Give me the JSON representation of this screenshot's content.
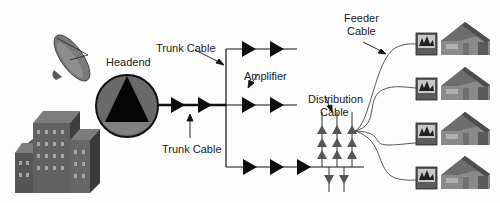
{
  "diagram": {
    "type": "cable-tv-network-topology",
    "labels": {
      "headend": "Headend",
      "trunk_cable_top": "Trunk Cable",
      "trunk_cable_bottom": "Trunk Cable",
      "amplifier": "Amplifier",
      "distribution_cable_line1": "Distribution",
      "distribution_cable_line2": "Cable",
      "feeder_cable_line1": "Feeder",
      "feeder_cable_line2": "Cable"
    },
    "nodes": [
      {
        "id": "satellite-dish",
        "kind": "icon"
      },
      {
        "id": "office-building",
        "kind": "icon"
      },
      {
        "id": "headend",
        "kind": "hub"
      },
      {
        "id": "trunk-amplifiers",
        "count": 2
      },
      {
        "id": "branch-top-amplifiers",
        "count": 2
      },
      {
        "id": "branch-middle-amplifiers",
        "count": 2
      },
      {
        "id": "branch-bottom-amplifiers",
        "count": 3
      },
      {
        "id": "distribution-taps-up",
        "count": 9
      },
      {
        "id": "distribution-taps-down",
        "count": 2
      },
      {
        "id": "subscriber-homes",
        "count": 4,
        "each_has": "television"
      }
    ],
    "colors": {
      "line": "#111111",
      "amplifier": "#0d0d0d",
      "tap": "#555555",
      "headend_fill": "#6a6a6a",
      "building": "#6b6b6b",
      "house": "#8a8a8a"
    }
  }
}
